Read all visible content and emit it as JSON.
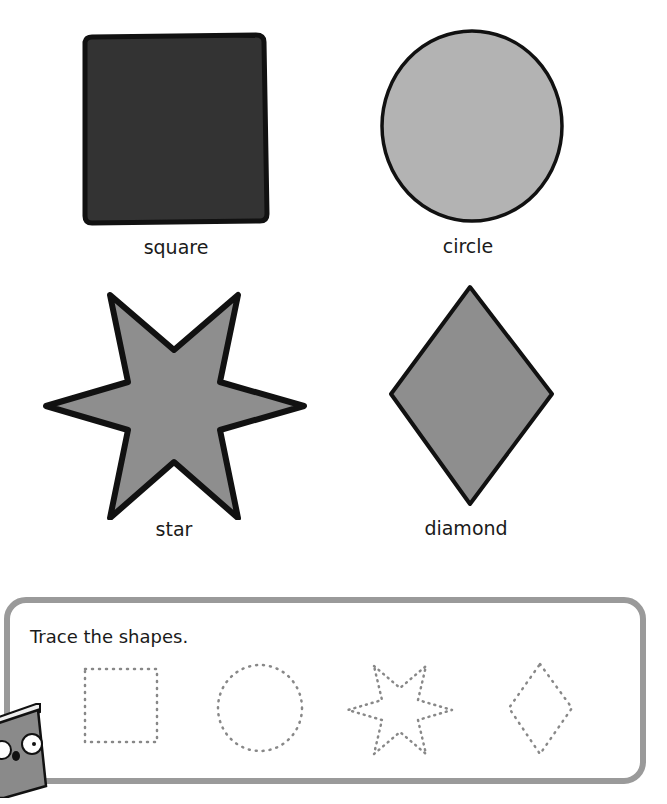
{
  "shapes": [
    {
      "name": "square",
      "label": "square",
      "fill": "#333333"
    },
    {
      "name": "circle",
      "label": "circle",
      "fill": "#b3b3b3"
    },
    {
      "name": "star",
      "label": "star",
      "fill": "#8e8e8e"
    },
    {
      "name": "diamond",
      "label": "diamond",
      "fill": "#8e8e8e"
    }
  ],
  "activity": {
    "instruction": "Trace the shapes.",
    "trace_shapes": [
      "square",
      "circle",
      "star",
      "diamond"
    ]
  },
  "colors": {
    "panel_border": "#9a9a9a",
    "outline": "#111111"
  }
}
